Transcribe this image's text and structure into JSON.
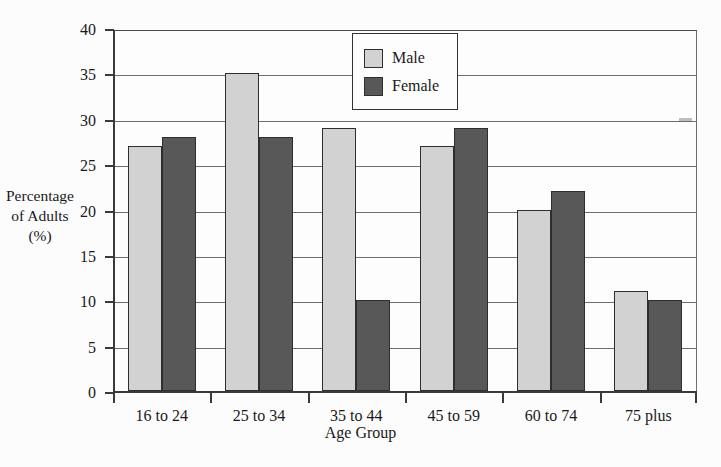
{
  "chart_data": {
    "type": "bar",
    "title": "",
    "xlabel": "Age Group",
    "ylabel": "Percentage of Adults (%)",
    "ylabel_lines": [
      "Percentage",
      "of Adults",
      "(%)"
    ],
    "categories": [
      "16 to 24",
      "25 to 34",
      "35 to 44",
      "45 to 59",
      "60 to 74",
      "75 plus"
    ],
    "series": [
      {
        "name": "Male",
        "color": "#d2d2d2",
        "values": [
          27,
          35,
          29,
          27,
          20,
          11
        ]
      },
      {
        "name": "Female",
        "color": "#585858",
        "values": [
          28,
          28,
          10,
          29,
          22,
          10
        ]
      }
    ],
    "ylim": [
      0,
      40
    ],
    "ytick_values": [
      0,
      5,
      10,
      15,
      20,
      25,
      30,
      35,
      40
    ],
    "ytick_labels": [
      "0",
      "5",
      "10",
      "15",
      "20",
      "25",
      "30",
      "35",
      "40"
    ],
    "grid": true,
    "grid_axis": "y",
    "legend_position": "top-center",
    "legend_entries": [
      "Male",
      "Female"
    ]
  },
  "axis": {
    "y_label_line1": "Percentage",
    "y_label_line2": "of Adults",
    "y_label_line3": "(%)",
    "x_axis_title": "Age Group"
  },
  "legend": {
    "male_label": "Male",
    "female_label": "Female"
  }
}
